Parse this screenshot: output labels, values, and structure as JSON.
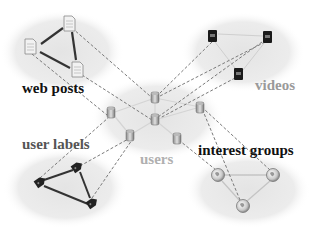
{
  "diagram": {
    "type": "heterogeneous-network",
    "groups": [
      {
        "id": "web_posts",
        "label": "web posts",
        "icon": "document-icon",
        "label_color": "#111111"
      },
      {
        "id": "videos",
        "label": "videos",
        "icon": "video-icon",
        "label_color": "#9a9a9a"
      },
      {
        "id": "users",
        "label": "users",
        "icon": "user-icon",
        "label_color": "#9a9a9a"
      },
      {
        "id": "user_labels",
        "label": "user labels",
        "icon": "tag-icon",
        "label_color": "#555555"
      },
      {
        "id": "interest_groups",
        "label": "interest groups",
        "icon": "globe-icon",
        "label_color": "#111111"
      }
    ],
    "colors": {
      "cluster_fill": "#e9e9e9",
      "intra_edge_dark": "#333333",
      "intra_edge_light": "#cfcfcf",
      "cross_edge": "#777777"
    }
  }
}
